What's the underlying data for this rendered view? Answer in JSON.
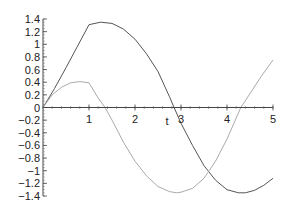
{
  "chart_data": {
    "type": "line",
    "title": "",
    "xlabel": "t",
    "ylabel": "",
    "xlim": [
      0,
      5
    ],
    "ylim": [
      -1.4,
      1.4
    ],
    "grid": false,
    "legend": null,
    "x_ticks": [
      "1",
      "2",
      "3",
      "4",
      "5"
    ],
    "y_ticks": [
      "1.4",
      "1.2",
      "1",
      "0.8",
      "0.6",
      "0.4",
      "0.2",
      "0",
      "-0.2",
      "-0.4",
      "-0.6",
      "-0.8",
      "-1",
      "-1.2",
      "-1.4"
    ],
    "series": [
      {
        "name": "curve-1",
        "color": "#555555",
        "x": [
          0,
          0.25,
          0.5,
          0.75,
          1.0,
          1.25,
          1.5,
          1.75,
          2.0,
          2.25,
          2.5,
          2.75,
          2.85,
          3.0,
          3.25,
          3.5,
          3.75,
          4.0,
          4.25,
          4.4,
          4.6,
          4.8,
          5.0
        ],
        "values": [
          0,
          0.3,
          0.63,
          0.97,
          1.31,
          1.35,
          1.33,
          1.24,
          1.08,
          0.85,
          0.57,
          0.17,
          0,
          -0.25,
          -0.6,
          -0.92,
          -1.15,
          -1.3,
          -1.35,
          -1.35,
          -1.31,
          -1.23,
          -1.12
        ]
      },
      {
        "name": "curve-2",
        "color": "#aaaaaa",
        "x": [
          0,
          0.2,
          0.4,
          0.6,
          0.8,
          1.0,
          1.2,
          1.35,
          1.5,
          1.75,
          2.0,
          2.25,
          2.5,
          2.75,
          2.9,
          3.0,
          3.25,
          3.5,
          3.75,
          4.0,
          4.3,
          4.5,
          4.75,
          5.0
        ],
        "values": [
          0,
          0.2,
          0.32,
          0.39,
          0.41,
          0.39,
          0.15,
          0,
          -0.2,
          -0.55,
          -0.85,
          -1.08,
          -1.25,
          -1.33,
          -1.35,
          -1.34,
          -1.28,
          -1.12,
          -0.85,
          -0.5,
          0,
          0.22,
          0.5,
          0.75
        ]
      },
      {
        "name": "curve-3",
        "color": "#66cc66",
        "x": [
          0,
          1.0
        ],
        "values": [
          0,
          0
        ]
      }
    ]
  }
}
